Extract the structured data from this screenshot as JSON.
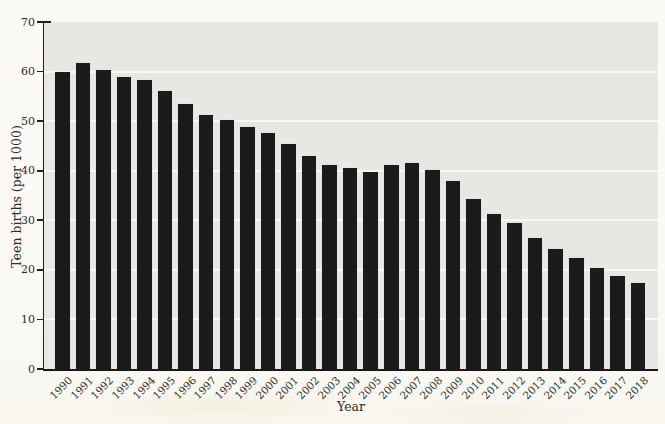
{
  "chart_data": {
    "type": "bar",
    "title": "",
    "xlabel": "Year",
    "ylabel": "Teen births (per 1000)",
    "categories": [
      "1990",
      "1991",
      "1992",
      "1993",
      "1994",
      "1995",
      "1996",
      "1997",
      "1998",
      "1999",
      "2000",
      "2001",
      "2002",
      "2003",
      "2004",
      "2005",
      "2006",
      "2007",
      "2008",
      "2009",
      "2010",
      "2011",
      "2012",
      "2013",
      "2014",
      "2015",
      "2016",
      "2017",
      "2018"
    ],
    "values": [
      59.9,
      61.8,
      60.3,
      59.0,
      58.2,
      56.0,
      53.5,
      51.3,
      50.3,
      48.8,
      47.7,
      45.3,
      43.0,
      41.1,
      40.5,
      39.7,
      41.1,
      41.5,
      40.2,
      37.9,
      34.2,
      31.3,
      29.4,
      26.5,
      24.2,
      22.3,
      20.3,
      18.8,
      17.4
    ],
    "ylim": [
      0,
      70
    ],
    "yticks": [
      0,
      10,
      20,
      30,
      40,
      50,
      60,
      70
    ],
    "grid": true,
    "legend_position": "none",
    "x_tick_rotation": 45,
    "colors": {
      "bar": "#1b1b1b",
      "plot_background": "#e8e7e4",
      "gridline": "#f8f8f5",
      "page_background": "#faf9f5",
      "axis": "#21201e",
      "text": "#2e2c29"
    }
  }
}
